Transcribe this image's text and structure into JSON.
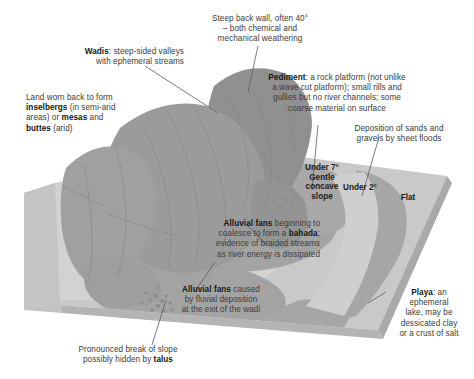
{
  "figure": {
    "type": "block-diagram"
  },
  "palette": {
    "background": "#ffffff",
    "mountain": "#9b9b9b",
    "mountain_dark": "#8d8d8d",
    "mountain_light": "#a8a8a8",
    "fan": "#a3a3a3",
    "pediment": "#d2d2d2",
    "plain": "#c9c9c9",
    "playa": "#a6a6a6",
    "block_side": "#c2c2c2",
    "block_edge": "#a9a9a9",
    "leader": "#5a5a5a",
    "text": "#3c3c3c",
    "text_bold": "#161616"
  },
  "labels": {
    "steep_back_wall": "Steep back wall, often 40°\n– both chemical and\nmechanical weathering",
    "wadis_bold": "Wadis",
    "wadis_rest": ": steep-sided valleys\nwith ephemeral streams",
    "inselbergs_line1": "Land worn back to form",
    "inselbergs_bold1": "inselbergs",
    "inselbergs_mid": " (in semi-arid\nareas) or ",
    "inselbergs_bold2": "mesas",
    "inselbergs_mid2": " and\n",
    "inselbergs_bold3": "buttes",
    "inselbergs_end": " (arid)",
    "pediment_bold": "Pediment",
    "pediment_rest": ": a rock platform (not unlike\na wave cut platform); small rills and\ngullies but no river channels; some\ncoarse material on surface",
    "deposition": "Deposition of sands and\ngravels by sheet floods",
    "bahada_bold": "Alluvial fans",
    "bahada_mid": " beginning to\ncoalesce to form a ",
    "bahada_bold2": "bahada",
    "bahada_rest": ";\nevidence of braided streams\nas river energy is dissipated",
    "fans_bold": "Alluvial fans",
    "fans_rest": " caused\nby fluvial deposition\nat the exit of the wadi",
    "break_slope_a": "Pronounced break of slope\npossibly hidden by ",
    "break_slope_bold": "talus",
    "playa_bold": "Playa",
    "playa_rest": ": an\nephemeral\nlake, may be\ndessicated clay\nor a crust of salt"
  },
  "map_annotations": {
    "under7": "Under 7°\nGentle\nconcave\nslope",
    "under2": "Under 2°",
    "flat": "Flat"
  }
}
